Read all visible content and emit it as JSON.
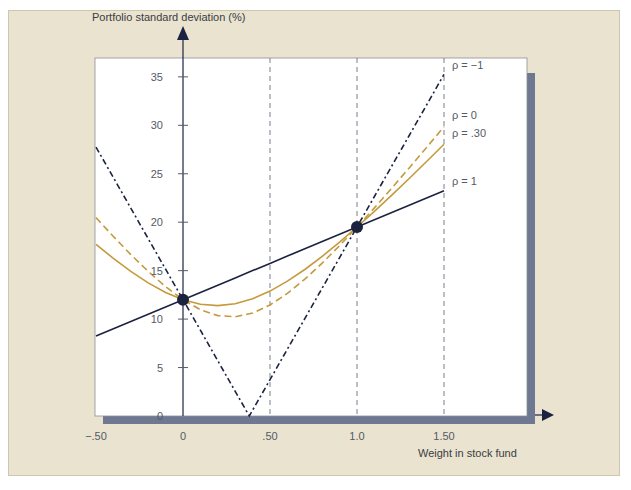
{
  "colors": {
    "panel_bg": "#e9e3cf",
    "plot_bg": "#ffffff",
    "shadow": "#6e7890",
    "navy": "#1c2340",
    "gold": "#c49a3c",
    "grid_dash": "#7a7f8c"
  },
  "chart_data": {
    "type": "line",
    "title": "",
    "xlabel": "Weight in stock fund",
    "ylabel": "Portfolio standard deviation (%)",
    "xlim": [
      -0.5,
      1.5
    ],
    "ylim": [
      0,
      35
    ],
    "grid": false,
    "x_ticks": [
      -0.5,
      0,
      0.5,
      1.0,
      1.5
    ],
    "x_tick_labels": [
      "−.50",
      "0",
      ".50",
      "1.0",
      "1.50"
    ],
    "y_ticks": [
      0,
      5,
      10,
      15,
      20,
      25,
      30,
      35
    ],
    "y_tick_labels": [
      "0",
      "5",
      "10",
      "15",
      "20",
      "25",
      "30",
      "35"
    ],
    "reference_vlines": [
      0.5,
      1.0,
      1.5
    ],
    "x": [
      -0.5,
      -0.4,
      -0.3,
      -0.2,
      -0.1,
      0,
      0.1,
      0.2,
      0.3,
      0.4,
      0.5,
      0.6,
      0.7,
      0.8,
      0.9,
      1.0,
      1.1,
      1.2,
      1.3,
      1.4,
      1.5
    ],
    "series": [
      {
        "name": "ρ = −1",
        "style": "dashdot",
        "color": "navy",
        "values": [
          27.75,
          24.6,
          21.45,
          18.3,
          15.15,
          12,
          8.85,
          5.7,
          2.55,
          0.6,
          3.75,
          6.9,
          10.05,
          13.2,
          16.35,
          19.5,
          22.65,
          25.8,
          28.95,
          32.1,
          35.25
        ],
        "v_vertex": {
          "x": 0.381,
          "y": 0
        }
      },
      {
        "name": "ρ = 0",
        "style": "dashed",
        "color": "gold",
        "values": [
          20.47,
          18.52,
          16.66,
          14.92,
          13.34,
          12,
          10.97,
          10.36,
          10.24,
          10.62,
          11.45,
          12.65,
          14.12,
          15.78,
          17.59,
          19.5,
          21.48,
          23.52,
          25.6,
          27.72,
          29.86
        ]
      },
      {
        "name": "ρ = .30",
        "style": "solid",
        "color": "gold",
        "values": [
          17.71,
          16.26,
          14.93,
          13.74,
          12.75,
          12,
          11.54,
          11.39,
          11.59,
          12.1,
          12.89,
          13.92,
          15.12,
          16.48,
          17.95,
          19.5,
          21.12,
          22.8,
          24.51,
          26.26,
          28.04
        ]
      },
      {
        "name": "ρ = 1",
        "style": "solid",
        "color": "navy",
        "values": [
          8.25,
          9.0,
          9.75,
          10.5,
          11.25,
          12,
          12.75,
          13.5,
          14.25,
          15.0,
          15.75,
          16.5,
          17.25,
          18.0,
          18.75,
          19.5,
          20.25,
          21.0,
          21.75,
          22.5,
          23.25
        ]
      }
    ],
    "points": [
      {
        "x": 0,
        "y": 12,
        "label": "bond fund"
      },
      {
        "x": 1.0,
        "y": 19.5,
        "label": "stock fund"
      }
    ],
    "annotations": [
      {
        "text": "ρ = −1",
        "y_px": 65
      },
      {
        "text": "ρ = 0",
        "y_px": 115
      },
      {
        "text": "ρ = .30",
        "y_px": 133
      },
      {
        "text": "ρ = 1",
        "y_px": 181
      }
    ]
  }
}
